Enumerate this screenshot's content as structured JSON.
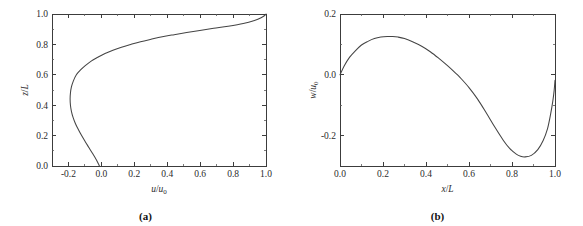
{
  "figure": {
    "name": "two-panel-velocity-profile-figure",
    "background_color": "#ffffff",
    "curve_color": "#444444",
    "axis_color": "#3c3c3c"
  },
  "panels": [
    {
      "id": "a",
      "caption": "(a)",
      "xlabel_main": "u",
      "xlabel_div": "/",
      "xlabel_den": "u",
      "xlabel_sub": "0",
      "xlabel": "u/u0",
      "ylabel_main": "z",
      "ylabel_div": "/",
      "ylabel_den": "L",
      "ylabel": "z/L",
      "xticks": [
        "-0.2",
        "0.0",
        "0.2",
        "0.4",
        "0.6",
        "0.8",
        "1.0"
      ],
      "yticks": [
        "0.0",
        "0.2",
        "0.4",
        "0.6",
        "0.8",
        "1.0"
      ]
    },
    {
      "id": "b",
      "caption": "(b)",
      "xlabel_main": "x",
      "xlabel_div": "/",
      "xlabel_den": "L",
      "xlabel_sub": "",
      "xlabel": "x/L",
      "ylabel_main": "w",
      "ylabel_div": "/",
      "ylabel_den": "u",
      "ylabel_sub": "0",
      "ylabel": "w/u0",
      "xticks": [
        "0.0",
        "0.2",
        "0.4",
        "0.6",
        "0.8",
        "1.0"
      ],
      "yticks": [
        "-0.2",
        "0.0",
        "0.2"
      ]
    }
  ],
  "chart_data": [
    {
      "type": "line",
      "panel": "a",
      "title": "",
      "xlabel": "u/u0",
      "ylabel": "z/L",
      "xlim": [
        -0.3,
        1.0
      ],
      "ylim": [
        0.0,
        1.0
      ],
      "xticks": [
        -0.2,
        0.0,
        0.2,
        0.4,
        0.6,
        0.8,
        1.0
      ],
      "yticks": [
        0.0,
        0.2,
        0.4,
        0.6,
        0.8,
        1.0
      ],
      "minor_ticks": true,
      "grid": false,
      "legend": "none",
      "orientation": "profile (x = velocity, y = height)",
      "series": [
        {
          "name": "horizontal velocity profile",
          "x": [
            -0.012,
            -0.016,
            -0.03,
            -0.052,
            -0.075,
            -0.098,
            -0.12,
            -0.14,
            -0.158,
            -0.172,
            -0.182,
            -0.188,
            -0.19,
            -0.188,
            -0.182,
            -0.17,
            -0.152,
            -0.128,
            -0.098,
            -0.062,
            -0.022,
            0.022,
            0.07,
            0.122,
            0.178,
            0.238,
            0.302,
            0.37,
            0.442,
            0.518,
            0.598,
            0.682,
            0.77,
            0.862,
            0.93,
            0.97,
            0.992,
            1.0
          ],
          "y": [
            0.0,
            0.01,
            0.04,
            0.08,
            0.12,
            0.16,
            0.2,
            0.24,
            0.28,
            0.32,
            0.36,
            0.4,
            0.44,
            0.48,
            0.52,
            0.56,
            0.6,
            0.63,
            0.66,
            0.69,
            0.715,
            0.74,
            0.762,
            0.782,
            0.8,
            0.818,
            0.834,
            0.85,
            0.864,
            0.878,
            0.892,
            0.906,
            0.92,
            0.938,
            0.958,
            0.975,
            0.99,
            1.0
          ]
        }
      ]
    },
    {
      "type": "line",
      "panel": "b",
      "title": "",
      "xlabel": "x/L",
      "ylabel": "w/u0",
      "xlim": [
        0.0,
        1.0
      ],
      "ylim": [
        -0.3,
        0.2
      ],
      "xticks": [
        0.0,
        0.2,
        0.4,
        0.6,
        0.8,
        1.0
      ],
      "yticks": [
        -0.2,
        0.0,
        0.2
      ],
      "minor_ticks": true,
      "grid": false,
      "legend": "none",
      "series": [
        {
          "name": "vertical velocity along surface",
          "x": [
            0.0,
            0.02,
            0.045,
            0.07,
            0.1,
            0.13,
            0.16,
            0.19,
            0.22,
            0.245,
            0.27,
            0.3,
            0.34,
            0.38,
            0.42,
            0.46,
            0.5,
            0.54,
            0.56,
            0.6,
            0.64,
            0.68,
            0.72,
            0.76,
            0.79,
            0.82,
            0.84,
            0.86,
            0.89,
            0.92,
            0.945,
            0.965,
            0.98,
            0.99,
            0.996,
            1.0
          ],
          "y": [
            0.0,
            0.03,
            0.058,
            0.078,
            0.098,
            0.11,
            0.119,
            0.124,
            0.126,
            0.126,
            0.124,
            0.119,
            0.108,
            0.094,
            0.076,
            0.054,
            0.03,
            0.004,
            -0.01,
            -0.042,
            -0.08,
            -0.125,
            -0.172,
            -0.216,
            -0.243,
            -0.261,
            -0.268,
            -0.27,
            -0.265,
            -0.246,
            -0.216,
            -0.178,
            -0.128,
            -0.086,
            -0.052,
            -0.018
          ]
        }
      ]
    }
  ]
}
